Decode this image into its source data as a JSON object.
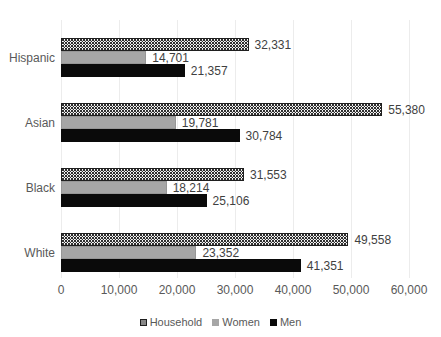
{
  "chart_data": {
    "type": "bar",
    "orientation": "horizontal",
    "title": "",
    "categories": [
      "Hispanic",
      "Asian",
      "Black",
      "White"
    ],
    "series": [
      {
        "name": "Household",
        "style": "dotted",
        "values": [
          32331,
          55380,
          31553,
          49558
        ],
        "labels": [
          "32,331",
          "55,380",
          "31,553",
          "49,558"
        ]
      },
      {
        "name": "Women",
        "style": "gray",
        "values": [
          14701,
          19781,
          18214,
          23352
        ],
        "labels": [
          "14,701",
          "19,781",
          "18,214",
          "23,352"
        ]
      },
      {
        "name": "Men",
        "style": "black",
        "values": [
          21357,
          30784,
          25106,
          41351
        ],
        "labels": [
          "21,357",
          "30,784",
          "25,106",
          "41,351"
        ]
      }
    ],
    "xlim": [
      0,
      60000
    ],
    "x_ticks": [
      {
        "value": 0,
        "label": "0"
      },
      {
        "value": 10000,
        "label": "10,000"
      },
      {
        "value": 20000,
        "label": "20,000"
      },
      {
        "value": 30000,
        "label": "30,000"
      },
      {
        "value": 40000,
        "label": "40,000"
      },
      {
        "value": 50000,
        "label": "50,000"
      },
      {
        "value": 60000,
        "label": "60,000"
      }
    ],
    "grid": true,
    "legend": {
      "position": "bottom",
      "items": [
        "Household",
        "Women",
        "Men"
      ]
    },
    "colors": {
      "household_fill": "#ffffff",
      "household_dot": "#2e2e2e",
      "household_border": "#1f1f1f",
      "women_fill": "#a6a6a6",
      "men_fill": "#0a0a0a",
      "gridline": "#ececec",
      "axis_text": "#595959",
      "value_text": "#3f3f3f"
    }
  }
}
